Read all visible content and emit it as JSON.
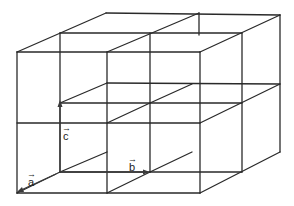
{
  "diagram": {
    "vectors": [
      {
        "name": "a",
        "label": "a"
      },
      {
        "name": "b",
        "label": "b"
      },
      {
        "name": "c",
        "label": "c"
      }
    ],
    "arrow_glyph": "→",
    "colors": {
      "lines": "#2a2a2a",
      "background": "#ffffff"
    }
  }
}
